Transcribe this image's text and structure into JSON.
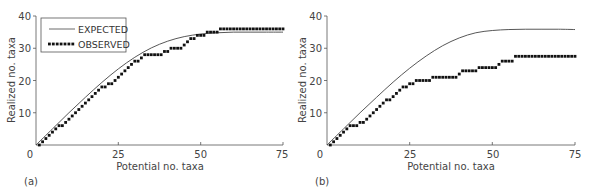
{
  "figure": {
    "panels": [
      "(a)",
      "(b)"
    ]
  },
  "chart_data": [
    {
      "type": "line",
      "panel": "(a)",
      "title": "",
      "xlabel": "Potential no. taxa",
      "ylabel": "Realized no. taxa",
      "xlim": [
        0,
        75
      ],
      "ylim": [
        0,
        40
      ],
      "xticks": [
        0,
        25,
        50,
        75
      ],
      "yticks": [
        10,
        20,
        30,
        40
      ],
      "grid": false,
      "legend": {
        "position": "upper-left",
        "entries": [
          "EXPECTED",
          "OBSERVED"
        ]
      },
      "series": [
        {
          "name": "EXPECTED",
          "style": "line",
          "x": [
            0,
            5,
            10,
            15,
            20,
            25,
            30,
            35,
            40,
            45,
            50,
            55,
            60,
            65,
            70,
            75
          ],
          "y": [
            0,
            5,
            10,
            14.8,
            19.4,
            23.6,
            27.2,
            30.1,
            32.2,
            33.6,
            34.4,
            34.8,
            35,
            35,
            35,
            35
          ]
        },
        {
          "name": "OBSERVED",
          "style": "dots",
          "x": [
            1,
            2,
            3,
            4,
            5,
            6,
            7,
            8,
            9,
            10,
            11,
            12,
            13,
            14,
            15,
            16,
            17,
            18,
            19,
            20,
            21,
            22,
            23,
            24,
            25,
            26,
            27,
            28,
            29,
            30,
            31,
            32,
            33,
            34,
            35,
            36,
            37,
            38,
            39,
            40,
            41,
            42,
            43,
            44,
            45,
            46,
            47,
            48,
            49,
            50,
            51,
            52,
            53,
            54,
            55,
            56,
            57,
            58,
            59,
            60,
            61,
            62,
            63,
            64,
            65,
            66,
            67,
            68,
            69,
            70,
            71,
            72,
            73,
            74,
            75
          ],
          "y": [
            0,
            1,
            2,
            3,
            4,
            5,
            6,
            6,
            7,
            8,
            9,
            10,
            11,
            12,
            13,
            14,
            15,
            16,
            17,
            18,
            18,
            19,
            19,
            20,
            21,
            22,
            23,
            24,
            25,
            26,
            26,
            27,
            28,
            28,
            28,
            28,
            28,
            28,
            29,
            29,
            30,
            30,
            30,
            30,
            31,
            32,
            33,
            33,
            34,
            34,
            34,
            35,
            35,
            35,
            35,
            36,
            36,
            36,
            36,
            36,
            36,
            36,
            36,
            36,
            36,
            36,
            36,
            36,
            36,
            36,
            36,
            36,
            36,
            36,
            36
          ]
        }
      ]
    },
    {
      "type": "line",
      "panel": "(b)",
      "title": "",
      "xlabel": "Potential no. taxa",
      "ylabel": "Realized no. taxa",
      "xlim": [
        0,
        75
      ],
      "ylim": [
        0,
        40
      ],
      "xticks": [
        0,
        25,
        50,
        75
      ],
      "yticks": [
        10,
        20,
        30,
        40
      ],
      "grid": false,
      "legend": null,
      "series": [
        {
          "name": "EXPECTED",
          "style": "line",
          "x": [
            0,
            5,
            10,
            15,
            20,
            25,
            30,
            35,
            40,
            45,
            50,
            55,
            60,
            65,
            70,
            75
          ],
          "y": [
            0,
            5,
            10,
            14.8,
            19.5,
            23.8,
            27.6,
            30.8,
            33.2,
            34.8,
            35.5,
            35.8,
            35.9,
            35.9,
            35.9,
            35.8
          ]
        },
        {
          "name": "OBSERVED",
          "style": "dots",
          "x": [
            1,
            2,
            3,
            4,
            5,
            6,
            7,
            8,
            9,
            10,
            11,
            12,
            13,
            14,
            15,
            16,
            17,
            18,
            19,
            20,
            21,
            22,
            23,
            24,
            25,
            26,
            27,
            28,
            29,
            30,
            31,
            32,
            33,
            34,
            35,
            36,
            37,
            38,
            39,
            40,
            41,
            42,
            43,
            44,
            45,
            46,
            47,
            48,
            49,
            50,
            51,
            52,
            53,
            54,
            55,
            56,
            57,
            58,
            59,
            60,
            61,
            62,
            63,
            64,
            65,
            66,
            67,
            68,
            69,
            70,
            71,
            72,
            73,
            74,
            75
          ],
          "y": [
            0,
            1,
            2,
            3,
            4,
            5,
            6,
            6,
            6,
            7,
            7,
            8,
            9,
            10,
            11,
            12,
            13,
            14,
            14,
            15,
            16,
            17,
            18,
            18,
            19,
            19,
            20,
            20,
            20,
            20,
            20,
            21,
            21,
            21,
            21,
            21,
            21,
            21,
            21,
            22,
            23,
            23,
            23,
            23,
            23,
            24,
            24,
            24,
            24,
            24,
            24,
            25,
            26,
            26,
            26,
            26,
            27.5,
            27.5,
            27.5,
            27.5,
            27.5,
            27.5,
            27.5,
            27.5,
            27.5,
            27.5,
            27.5,
            27.5,
            27.5,
            27.5,
            27.5,
            27.5,
            27.5,
            27.5,
            27.5
          ]
        }
      ]
    }
  ]
}
